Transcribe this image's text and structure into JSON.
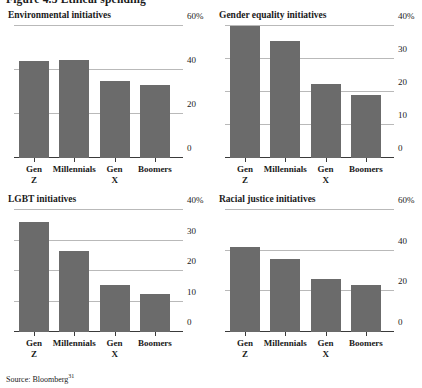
{
  "figure": {
    "heading": "Figure 4.3 Ethical spending",
    "source_label": "Source: Bloomberg",
    "source_note": "31"
  },
  "chart_data": [
    {
      "type": "bar",
      "title": "Environmental initiatives",
      "categories": [
        "Gen Z",
        "Millennials",
        "Gen X",
        "Boomers"
      ],
      "category_lines": [
        [
          "Gen",
          "Z"
        ],
        [
          "Millennials",
          ""
        ],
        [
          "Gen",
          "X"
        ],
        [
          "Boomers",
          ""
        ]
      ],
      "values": [
        44,
        44.5,
        35,
        33
      ],
      "xlabel": "",
      "ylabel": "",
      "ylim": [
        0,
        60
      ],
      "yticks": [
        0,
        20,
        40,
        60
      ],
      "ytick_labels": [
        "0",
        "20",
        "40",
        "60%"
      ],
      "grid": true,
      "legend": "none",
      "bar_color": "#6b6b6b"
    },
    {
      "type": "bar",
      "title": "Gender equality initiatives",
      "categories": [
        "Gen Z",
        "Millennials",
        "Gen X",
        "Boomers"
      ],
      "category_lines": [
        [
          "Gen",
          "Z"
        ],
        [
          "Millennials",
          ""
        ],
        [
          "Gen",
          "X"
        ],
        [
          "Boomers",
          ""
        ]
      ],
      "values": [
        40,
        35.5,
        22.5,
        19
      ],
      "xlabel": "",
      "ylabel": "",
      "ylim": [
        0,
        40
      ],
      "yticks": [
        0,
        10,
        20,
        30,
        40
      ],
      "ytick_labels": [
        "0",
        "10",
        "20",
        "30",
        "40%"
      ],
      "grid": true,
      "legend": "none",
      "bar_color": "#6b6b6b"
    },
    {
      "type": "bar",
      "title": "LGBT initiatives",
      "categories": [
        "Gen Z",
        "Millennials",
        "Gen X",
        "Boomers"
      ],
      "category_lines": [
        [
          "Gen",
          "Z"
        ],
        [
          "Millennials",
          ""
        ],
        [
          "Gen",
          "X"
        ],
        [
          "Boomers",
          ""
        ]
      ],
      "values": [
        36,
        26.5,
        15.5,
        12.5
      ],
      "xlabel": "",
      "ylabel": "",
      "ylim": [
        0,
        40
      ],
      "yticks": [
        0,
        10,
        20,
        30,
        40
      ],
      "ytick_labels": [
        "0",
        "10",
        "20",
        "30",
        "40%"
      ],
      "grid": true,
      "legend": "none",
      "bar_color": "#6b6b6b"
    },
    {
      "type": "bar",
      "title": "Racial justice initiatives",
      "categories": [
        "Gen Z",
        "Millennials",
        "Gen X",
        "Boomers"
      ],
      "category_lines": [
        [
          "Gen",
          "Z"
        ],
        [
          "Millennials",
          ""
        ],
        [
          "Gen",
          "X"
        ],
        [
          "Boomers",
          ""
        ]
      ],
      "values": [
        42,
        36,
        26,
        23
      ],
      "xlabel": "",
      "ylabel": "",
      "ylim": [
        0,
        60
      ],
      "yticks": [
        0,
        20,
        40,
        60
      ],
      "ytick_labels": [
        "0",
        "20",
        "40",
        "60%"
      ],
      "grid": true,
      "legend": "none",
      "bar_color": "#6b6b6b"
    }
  ]
}
